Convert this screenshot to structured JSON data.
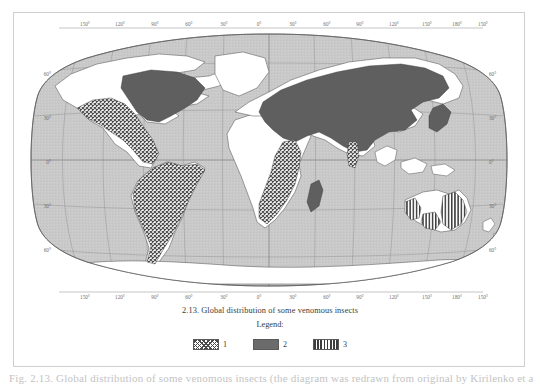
{
  "figure": {
    "caption": "2.13. Global distribution of some venomous insects",
    "legend_title": "Legend:",
    "legend_items": [
      {
        "label": "1",
        "pattern": "crosshatch",
        "meaning": "crosshatch-fill-area"
      },
      {
        "label": "2",
        "pattern": "solid",
        "meaning": "solid-dark-fill-area"
      },
      {
        "label": "3",
        "pattern": "vertical-stripes",
        "meaning": "vertical-stripe-fill-area"
      }
    ]
  },
  "map": {
    "projection": "robinson",
    "ocean_color": "#c9c9c9",
    "land_color": "#ffffff",
    "coastline_color": "#4a4a4a",
    "graticule_color": "#8a8a8a",
    "fill_solid_color": "#5f5f5f",
    "fill_hatch_color": "#4a4a4a",
    "longitude_labels_top": [
      "150°",
      "120°",
      "90°",
      "60°",
      "30°",
      "0°",
      "30°",
      "60°",
      "90°",
      "120°",
      "150°",
      "180°",
      "150°"
    ],
    "longitude_labels_bottom": [
      "150°",
      "120°",
      "90°",
      "60°",
      "30°",
      "0°",
      "30°",
      "60°",
      "90°",
      "120°",
      "150°",
      "180°",
      "150°"
    ],
    "latitude_labels_left": [
      "60°",
      "30°",
      "0°",
      "30°",
      "60°"
    ],
    "latitude_labels_right": [
      "60°",
      "30°",
      "0°",
      "30°",
      "60°"
    ],
    "regions": [
      {
        "name": "north-america-eastern-usa-canada",
        "pattern": "solid"
      },
      {
        "name": "western-usa-mexico-central-america",
        "pattern": "crosshatch"
      },
      {
        "name": "south-america",
        "pattern": "crosshatch"
      },
      {
        "name": "eurasia-north-africa-middle-east-china",
        "pattern": "solid"
      },
      {
        "name": "japan-korea",
        "pattern": "solid"
      },
      {
        "name": "southern-africa-east-coast",
        "pattern": "crosshatch"
      },
      {
        "name": "madagascar",
        "pattern": "solid"
      },
      {
        "name": "india-west-coast",
        "pattern": "crosshatch"
      },
      {
        "name": "australia-south-east-and-south-west-coast",
        "pattern": "vertical-stripes"
      }
    ]
  },
  "footer": {
    "cut_text": "Fig. 2.13.  Global distribution of some venomous insects (the diagram was redrawn from original by Kirilenko et al.)"
  }
}
